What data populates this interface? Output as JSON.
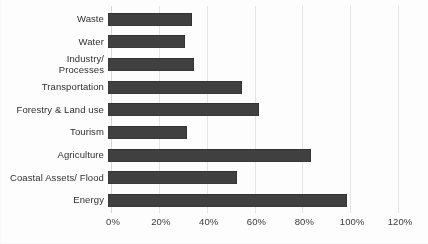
{
  "chart_data": {
    "type": "bar",
    "orientation": "horizontal",
    "title": "",
    "subtitle": "",
    "xlabel": "",
    "ylabel": "",
    "xlim": [
      0,
      120
    ],
    "xtick_labels": [
      "0%",
      "20%",
      "40%",
      "60%",
      "80%",
      "100%",
      "120%"
    ],
    "xtick_values": [
      0,
      20,
      40,
      60,
      80,
      100,
      120
    ],
    "grid": "vertical",
    "legend": "none",
    "bar_color": "#404040",
    "categories": [
      "Waste",
      "Water",
      "Industry/\nProcesses",
      "Transportation",
      "Forestry & Land use",
      "Tourism",
      "Agriculture",
      "Coastal Assets/ Flood",
      "Energy"
    ],
    "values": [
      35,
      32,
      36,
      56,
      63,
      33,
      85,
      54,
      100
    ],
    "value_labels": [
      "35%",
      "32%",
      "36%",
      "56%",
      "63%",
      "33%",
      "85%",
      "54%",
      "100%"
    ]
  },
  "colors": {
    "bar": "#404040",
    "gridline": "#e4e4e4",
    "axis_text": "#3a3a3a",
    "background": "#fdfdfd"
  }
}
